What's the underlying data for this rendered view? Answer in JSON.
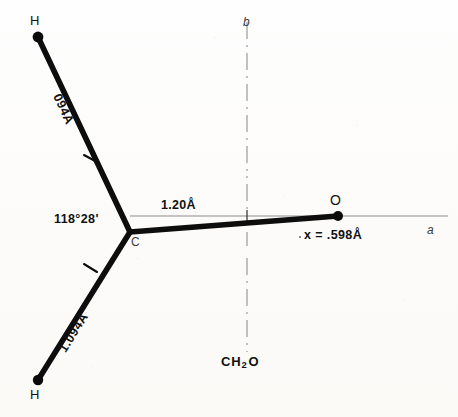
{
  "figure": {
    "caption": "CH2O",
    "caption_formula": {
      "prefix": "CH",
      "subscript": "2",
      "suffix": "O"
    },
    "molecule": "formaldehyde",
    "background_color": "#fdfdfb",
    "ink_color": "#111111"
  },
  "atoms": [
    {
      "id": "H-top",
      "label": "H",
      "x": 38,
      "y": 37,
      "label_x": 31,
      "label_y": 16
    },
    {
      "id": "H-bottom",
      "label": "H",
      "x": 38,
      "y": 380,
      "label_x": 31,
      "label_y": 389
    },
    {
      "id": "C-center",
      "label": "C",
      "x": 130,
      "y": 232,
      "label_x": 133,
      "label_y": 237
    },
    {
      "id": "O-right",
      "label": "O",
      "x": 338,
      "y": 215,
      "label_x": 331,
      "label_y": 195
    }
  ],
  "bonds": [
    {
      "id": "C-H-upper",
      "label": "094Å",
      "from": "C-center",
      "to": "H-top",
      "length_value": "1.094",
      "unit": "Å"
    },
    {
      "id": "C-H-lower",
      "label": "1.094Å",
      "from": "C-center",
      "to": "H-bottom",
      "length_value": "1.094",
      "unit": "Å"
    },
    {
      "id": "C-O",
      "label": "1.20Å",
      "from": "C-center",
      "to": "O-right",
      "length_value": "1.20",
      "unit": "Å"
    }
  ],
  "angles": [
    {
      "id": "HCH-or-HCO",
      "label": "118°28'",
      "degrees": "118",
      "minutes": "28"
    }
  ],
  "axes": [
    {
      "id": "a-axis",
      "label": "a",
      "orientation": "horizontal",
      "style": "solid-thin",
      "label_x": 428,
      "label_y": 228
    },
    {
      "id": "b-axis",
      "label": "b",
      "orientation": "vertical",
      "style": "dash-dot",
      "label_x": 244,
      "label_y": 19
    }
  ],
  "annotations": [
    {
      "id": "x-offset",
      "label": "x = .598Å",
      "value": ".598",
      "unit": "Å",
      "x": 297,
      "y": 232
    }
  ]
}
